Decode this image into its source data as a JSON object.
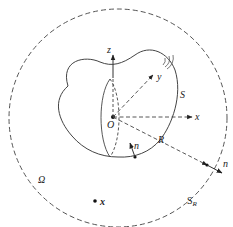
{
  "diagram": {
    "labels": {
      "z_axis": "z",
      "y_axis": "y",
      "x_axis": "x",
      "origin": "O",
      "surface": "S",
      "radius": "R",
      "normal_inner": "n",
      "normal_outer": "n",
      "domain": "Ω",
      "outer_sphere_main": "S",
      "outer_sphere_sub": "R",
      "field_point": "x"
    },
    "colors": {
      "stroke": "#444444",
      "text": "#222222",
      "background": "#ffffff"
    }
  }
}
